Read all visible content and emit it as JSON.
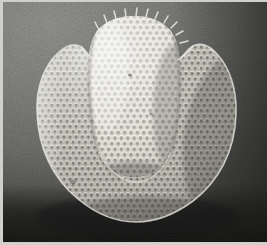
{
  "figure": {
    "domain_label": "scanning-electron-micrograph",
    "orientation": "frontal view",
    "caption": "",
    "scale_bar_label": "",
    "magnification_label": "",
    "panel_label": ""
  },
  "canvas": {
    "width": 267,
    "height": 245,
    "plate_border_color": "#cfcfcb",
    "border_px": 3
  },
  "background": {
    "name": "specimen-stub",
    "highlight_color": "#7b7b79",
    "midtone_color": "#62625f",
    "shadow_color": "#1a1a19",
    "light_direction": "upper-left",
    "grain": "fine film grain"
  },
  "eye": {
    "name": "compound-eye",
    "outline_color": "#d8d6cf",
    "facet_highlight": "#e9e7df",
    "facet_shadow": "#6d6b63",
    "body_light": "#cdcbc2",
    "body_mid": "#a6a49b",
    "body_dark": "#7c7a72",
    "center_x": 132,
    "center_y": 130,
    "radius_x": 97,
    "radius_y": 95,
    "facet_count_approx": 760,
    "facet_pitch_px": 6.1,
    "facet_shape": "hexagon"
  },
  "protrusion": {
    "name": "central-dome-outgrowth",
    "description": "bright ellipsoidal dome rising from the dorsal-central region of the eye",
    "center_x": 131,
    "center_y": 92,
    "radius_x": 44,
    "radius_y": 73,
    "highlight_color": "#efede5",
    "shadow_color": "#8c8a81"
  },
  "bristles": {
    "name": "dorsal-bristle-row",
    "count": 11,
    "description": "small spike-like interommatidial bristles along the upper rim of the dome",
    "color": "#e4e2da"
  },
  "notches": {
    "name": "lateral-notch",
    "left_x": 62,
    "right_x": 203,
    "y": 48,
    "description": "shallow concave indentations where the dome meets the lateral eye fields"
  }
}
